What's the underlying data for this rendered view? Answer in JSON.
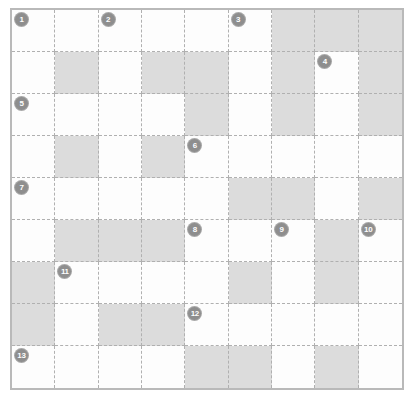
{
  "puzzle": {
    "title": "Crossword Grid",
    "rows": 9,
    "columns": 9,
    "colors": {
      "blocked_cell": "#dcdcdc",
      "open_cell": "#fdfdfd",
      "grid_line": "#b0b0b0",
      "frame": "#b9b9b9",
      "clue_badge": "#8e8e8e",
      "clue_badge_text": "#fdfdfd"
    },
    "legend": {
      "open_label": "open cell",
      "blocked_label": "blocked cell"
    },
    "grid": [
      [
        "open",
        "open",
        "open",
        "open",
        "open",
        "open",
        "blocked",
        "blocked",
        "blocked"
      ],
      [
        "open",
        "blocked",
        "open",
        "blocked",
        "blocked",
        "open",
        "blocked",
        "open",
        "blocked"
      ],
      [
        "open",
        "open",
        "open",
        "open",
        "blocked",
        "open",
        "blocked",
        "open",
        "blocked"
      ],
      [
        "open",
        "blocked",
        "open",
        "blocked",
        "open",
        "open",
        "open",
        "open",
        "open"
      ],
      [
        "open",
        "open",
        "open",
        "open",
        "open",
        "blocked",
        "blocked",
        "open",
        "blocked"
      ],
      [
        "open",
        "blocked",
        "blocked",
        "blocked",
        "open",
        "open",
        "open",
        "blocked",
        "open"
      ],
      [
        "blocked",
        "open",
        "open",
        "open",
        "open",
        "blocked",
        "open",
        "blocked",
        "open"
      ],
      [
        "blocked",
        "open",
        "blocked",
        "blocked",
        "open",
        "open",
        "open",
        "open",
        "open"
      ],
      [
        "open",
        "open",
        "open",
        "open",
        "blocked",
        "blocked",
        "open",
        "blocked",
        "open"
      ]
    ],
    "clue_numbers": [
      {
        "number": "1",
        "row": 1,
        "col": 1
      },
      {
        "number": "2",
        "row": 1,
        "col": 3
      },
      {
        "number": "3",
        "row": 1,
        "col": 6
      },
      {
        "number": "4",
        "row": 2,
        "col": 8
      },
      {
        "number": "5",
        "row": 3,
        "col": 1
      },
      {
        "number": "6",
        "row": 4,
        "col": 5
      },
      {
        "number": "7",
        "row": 5,
        "col": 1
      },
      {
        "number": "8",
        "row": 6,
        "col": 5
      },
      {
        "number": "9",
        "row": 6,
        "col": 7
      },
      {
        "number": "10",
        "row": 6,
        "col": 9
      },
      {
        "number": "11",
        "row": 7,
        "col": 2
      },
      {
        "number": "12",
        "row": 8,
        "col": 5
      },
      {
        "number": "13",
        "row": 9,
        "col": 1
      }
    ]
  }
}
